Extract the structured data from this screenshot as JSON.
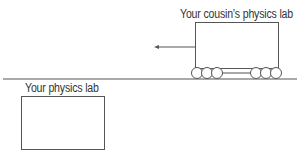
{
  "diagram": {
    "labels": {
      "cousin_lab": "Your cousin’s physics lab",
      "your_lab": "Your physics lab"
    },
    "colors": {
      "stroke": "#555555",
      "text": "#333333",
      "background": "#ffffff"
    },
    "elements": {
      "ground_line": {
        "x1": 3,
        "x2": 297,
        "y": 79
      },
      "moving_lab": {
        "x": 195,
        "y": 22,
        "width": 83,
        "height": 46,
        "direction": "left"
      },
      "motion_arrow": {
        "from_x": 195,
        "to_x": 154,
        "y": 47
      },
      "wheels": {
        "count": 6,
        "radius": 5.5,
        "left_group_x": [
          197,
          207,
          217
        ],
        "right_group_x": [
          256,
          266,
          276
        ],
        "y": 73
      },
      "stationary_lab": {
        "x": 21,
        "y": 96,
        "width": 83,
        "height": 53
      }
    }
  }
}
